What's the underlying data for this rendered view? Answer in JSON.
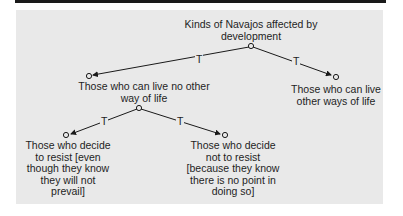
{
  "diagram": {
    "root": {
      "label_line1": "Kinds of Navajos affected by",
      "label_line2": "development"
    },
    "nodes": {
      "no_other": {
        "line1": "Those who can live no other",
        "line2": "way of life"
      },
      "other_ways": {
        "line1": "Those who can live",
        "line2": "other ways of life"
      },
      "resist": {
        "line1": "Those who decide",
        "line2": "to resist [even",
        "line3": "though they know",
        "line4": "they will not",
        "line5": "prevail]"
      },
      "not_resist": {
        "line1": "Those who decide",
        "line2": "not to resist",
        "line3": "[because they know",
        "line4": "there is no point in",
        "line5": "doing so]"
      }
    },
    "edge_labels": {
      "root_left": "T",
      "root_right": "T",
      "mid_left": "T",
      "mid_right": "T"
    },
    "colors": {
      "panel": "#e9e9e9",
      "ink": "#1a1a1a"
    }
  }
}
